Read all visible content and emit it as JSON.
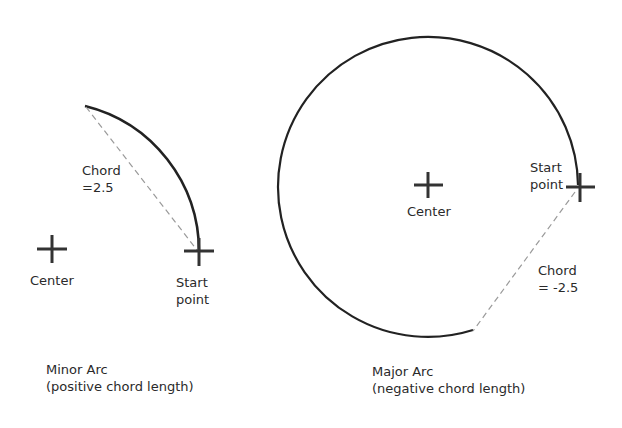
{
  "minor": {
    "chord_label_1": "Chord",
    "chord_label_2": "=2.5",
    "center_label": "Center",
    "start_label_1": "Start",
    "start_label_2": "point",
    "caption_1": "Minor Arc",
    "caption_2": "(positive chord length)"
  },
  "major": {
    "center_label": "Center",
    "start_label_1": "Start",
    "start_label_2": "point",
    "chord_label_1": "Chord",
    "chord_label_2": "= -2.5",
    "caption_1": "Major Arc",
    "caption_2": "(negative chord length)"
  },
  "colors": {
    "stroke": "#222222",
    "dash": "#999999",
    "text": "#2a2a2a"
  }
}
